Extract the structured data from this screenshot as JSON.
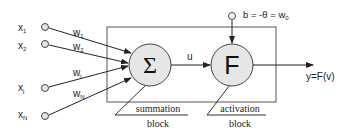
{
  "diagram": {
    "inputs": [
      {
        "label": "x",
        "sub": "1",
        "weight": "w",
        "wsub": "1"
      },
      {
        "label": "x",
        "sub": "2",
        "weight": "w",
        "wsub": "2"
      },
      {
        "label": "x",
        "sub": "j",
        "weight": "w",
        "wsub": "j"
      },
      {
        "label": "x",
        "sub": "N",
        "weight": "w",
        "wsub": "N"
      }
    ],
    "summation_symbol": "Σ",
    "activation_symbol": "F",
    "intermediate_label": "u",
    "bias_label": "b = -θ = w",
    "bias_sub": "0",
    "output_label": "y=F(v)",
    "summation_caption": [
      "summation",
      "block"
    ],
    "activation_caption": [
      "activation",
      "block"
    ],
    "colors": {
      "stroke": "#333333",
      "node_fill": "#e6e6e6",
      "text": "#222222"
    }
  }
}
